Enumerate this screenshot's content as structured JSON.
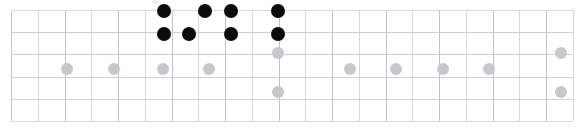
{
  "panel": {
    "name": "dot-grid-matrix",
    "width": 579,
    "height": 129,
    "background": "#ffffff"
  },
  "grid": {
    "left": 11,
    "top": 10,
    "right": 573,
    "bottom": 121,
    "columns": 21,
    "rows": 5,
    "col_width": 26.8,
    "row_height": 22.2,
    "line_color": "#d8d8dc",
    "major_line_color": "#c2c2c8",
    "border_color": "#b6b6bd",
    "major_column_step": 2
  },
  "legend": {
    "on_color": "#0b0b0b",
    "off_color": "#c8c8cc",
    "on_radius": 7,
    "off_radius": 6,
    "on_label": "active",
    "off_label": "inactive"
  },
  "chart_data": {
    "type": "scatter",
    "title": "",
    "subtitle": "",
    "xlabel": "",
    "ylabel": "",
    "grid": true,
    "legend_position": "none",
    "xlim": [
      0,
      21
    ],
    "ylim": [
      0,
      5
    ],
    "x_tick_labels": [],
    "y_tick_labels": [],
    "series": [
      {
        "name": "active",
        "color": "#0b0b0b",
        "marker": "circle-filled",
        "radius": 7,
        "points": [
          {
            "x": 164,
            "y": 11
          },
          {
            "x": 205,
            "y": 11
          },
          {
            "x": 231,
            "y": 11
          },
          {
            "x": 278,
            "y": 11
          },
          {
            "x": 164,
            "y": 34
          },
          {
            "x": 189,
            "y": 34
          },
          {
            "x": 231,
            "y": 34
          },
          {
            "x": 278,
            "y": 34
          }
        ]
      },
      {
        "name": "inactive",
        "color": "#c8c8cc",
        "marker": "circle-filled",
        "radius": 6,
        "points": [
          {
            "x": 278,
            "y": 53
          },
          {
            "x": 561,
            "y": 53
          },
          {
            "x": 67,
            "y": 69
          },
          {
            "x": 114,
            "y": 69
          },
          {
            "x": 163,
            "y": 69
          },
          {
            "x": 209,
            "y": 69
          },
          {
            "x": 350,
            "y": 69
          },
          {
            "x": 396,
            "y": 69
          },
          {
            "x": 443,
            "y": 69
          },
          {
            "x": 489,
            "y": 69
          },
          {
            "x": 278,
            "y": 92
          },
          {
            "x": 561,
            "y": 92
          }
        ]
      }
    ]
  }
}
